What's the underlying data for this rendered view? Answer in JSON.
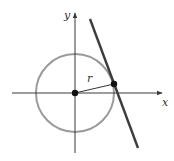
{
  "diagram": {
    "labels": {
      "x_axis": "x",
      "y_axis": "y",
      "radius": "r"
    },
    "colors": {
      "axis": "#3a3a3a",
      "circle": "#9a9a9a",
      "tangent_line": "#3c3c3c",
      "radius": "#333333",
      "point": "#111111"
    },
    "geometry": {
      "center": [
        75,
        93
      ],
      "radius_px": 39,
      "tangent_point": [
        114,
        84
      ],
      "tangent_line": [
        [
          90,
          19
        ],
        [
          138,
          148
        ]
      ],
      "x_axis": [
        [
          12,
          93
        ],
        [
          162,
          93
        ]
      ],
      "y_axis": [
        [
          75,
          153
        ],
        [
          75,
          13
        ]
      ]
    }
  }
}
